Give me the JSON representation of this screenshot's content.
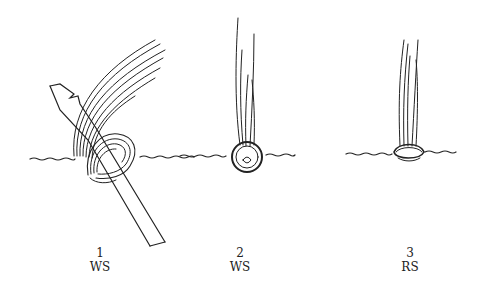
{
  "figures": [
    {
      "step": "1",
      "side": "WS",
      "caption_x": 100
    },
    {
      "step": "2",
      "side": "WS",
      "caption_x": 240
    },
    {
      "step": "3",
      "side": "RS",
      "caption_x": 384
    }
  ],
  "colors": {
    "ink": "#222222",
    "background": "#ffffff"
  }
}
